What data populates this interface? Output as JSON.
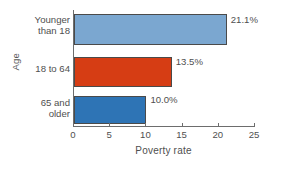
{
  "chart_data": {
    "type": "bar",
    "orientation": "horizontal",
    "title": "",
    "xlabel": "Poverty rate",
    "ylabel": "Age",
    "categories": [
      "Younger\nthan 18",
      "18 to 64",
      "65 and\nolder"
    ],
    "values": [
      21.1,
      13.5,
      10.0
    ],
    "data_labels": [
      "21.1%",
      "13.5%",
      "10.0%"
    ],
    "colors": [
      "#7BA7D0",
      "#D63D14",
      "#2E74B5"
    ],
    "bar_border_color": "#4A4A4A",
    "xlim": [
      0,
      25
    ],
    "xticks": [
      0,
      5,
      10,
      15,
      20,
      25
    ],
    "xtick_labels": [
      "0",
      "5",
      "10",
      "15",
      "20",
      "25"
    ],
    "grid": false,
    "legend": null,
    "axis_color": "#6D6D6D",
    "background": "#FFFFFF"
  }
}
